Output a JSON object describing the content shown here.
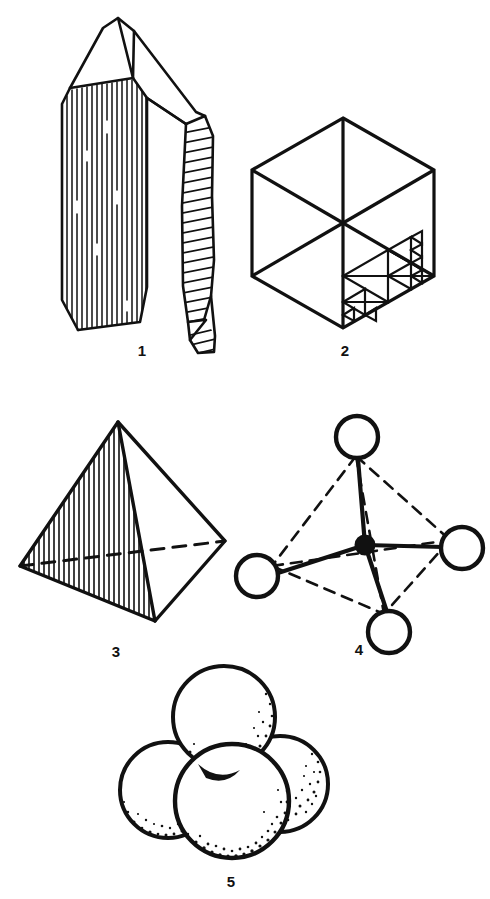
{
  "plate": {
    "title": "Quartz crystal and tetrahedral structure figures",
    "background_color": "#ffffff",
    "ink_color": "#111111",
    "width": 490,
    "height": 899
  },
  "figures": [
    {
      "number": "1",
      "caption": "1",
      "name": "quartz-crystal",
      "description": "Line drawing of a hexagonal quartz crystal with pyramidal termination, vertically striated left prism face and diagonally hatched right prism face",
      "caption_x": 142,
      "caption_y": 343
    },
    {
      "number": "2",
      "caption": "2",
      "name": "hexagonal-cube-fractal",
      "description": "Hexagon drawn as an isometric cube with three internal edges meeting at the centre; the lower right rhombic face is recursively subdivided into smaller triangles",
      "caption_x": 345,
      "caption_y": 343
    },
    {
      "number": "3",
      "caption": "3",
      "name": "hatched-tetrahedron",
      "description": "Solid tetrahedron in perspective with the front left face filled by fine vertical hatching and the hidden rear edge shown dashed",
      "caption_x": 116,
      "caption_y": 644
    },
    {
      "number": "4",
      "caption": "4",
      "name": "ball-and-stick-tetrahedron",
      "description": "Ball and stick tetrahedral model: a small filled central atom bonded by four solid bonds to four open circles, with dashed lines outlining the tetrahedron edges",
      "caption_x": 359,
      "caption_y": 642
    },
    {
      "number": "5",
      "caption": "5",
      "name": "space-filling-model",
      "description": "Space filling model of four mutually touching spheres with stippled shading along their lower right limbs",
      "caption_x": 231,
      "caption_y": 874
    }
  ]
}
